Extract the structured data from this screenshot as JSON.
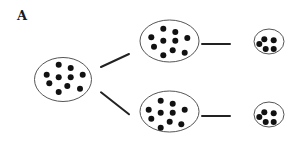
{
  "figure": {
    "panel_label": "A",
    "colors": {
      "outline": "#555555",
      "dot": "#111111",
      "edge": "#222222",
      "background": "#ffffff"
    },
    "dot_radius": 3,
    "nodes": [
      {
        "id": "root",
        "cx": 63,
        "cy": 79.5,
        "rx": 28.5,
        "ry": 22,
        "dots": [
          [
            58.7,
            64.7
          ],
          [
            70.7,
            68
          ],
          [
            46.7,
            74.7
          ],
          [
            58.7,
            77.3
          ],
          [
            70.7,
            77.3
          ],
          [
            82.7,
            74.7
          ],
          [
            49.3,
            83.3
          ],
          [
            67.3,
            86
          ],
          [
            58.7,
            92
          ],
          [
            80,
            88.7
          ]
        ]
      },
      {
        "id": "upper-middle",
        "cx": 169.5,
        "cy": 41,
        "rx": 29.5,
        "ry": 21,
        "dots": [
          [
            163.3,
            28.7
          ],
          [
            175.3,
            32
          ],
          [
            151.3,
            37.3
          ],
          [
            163.3,
            40.7
          ],
          [
            175.3,
            40.7
          ],
          [
            187.3,
            38
          ],
          [
            154,
            46.7
          ],
          [
            172.7,
            50.3
          ],
          [
            163.3,
            55.3
          ],
          [
            184.7,
            52.7
          ]
        ]
      },
      {
        "id": "lower-middle",
        "cx": 169.5,
        "cy": 111.5,
        "rx": 29.5,
        "ry": 20.5,
        "dots": [
          [
            160.7,
            100.7
          ],
          [
            172.7,
            103.7
          ],
          [
            148.7,
            109.7
          ],
          [
            160.7,
            112.7
          ],
          [
            172.7,
            112.7
          ],
          [
            184.7,
            109.7
          ],
          [
            151.3,
            118.7
          ],
          [
            169.7,
            121.7
          ],
          [
            160.7,
            127.7
          ],
          [
            181.3,
            124.3
          ]
        ]
      },
      {
        "id": "upper-right",
        "cx": 269,
        "cy": 41.5,
        "rx": 15,
        "ry": 12.5,
        "dots": [
          [
            264.3,
            39.3
          ],
          [
            273.7,
            40.3
          ],
          [
            259.3,
            44
          ],
          [
            265.7,
            49
          ],
          [
            273.7,
            49
          ]
        ]
      },
      {
        "id": "lower-right",
        "cx": 269,
        "cy": 114.5,
        "rx": 15,
        "ry": 12.5,
        "dots": [
          [
            264.3,
            112.3
          ],
          [
            273.7,
            113.3
          ],
          [
            259.3,
            117
          ],
          [
            265.7,
            122
          ],
          [
            273.7,
            122
          ]
        ]
      }
    ],
    "edges": [
      {
        "from": "root",
        "to": "upper-middle",
        "x1": 101,
        "y1": 67,
        "x2": 129,
        "y2": 54
      },
      {
        "from": "root",
        "to": "lower-middle",
        "x1": 101,
        "y1": 92.3,
        "x2": 129,
        "y2": 114.3
      },
      {
        "from": "upper-middle",
        "to": "upper-right",
        "x1": 202,
        "y1": 44,
        "x2": 230,
        "y2": 44
      },
      {
        "from": "lower-middle",
        "to": "lower-right",
        "x1": 202,
        "y1": 116,
        "x2": 230,
        "y2": 116
      }
    ]
  }
}
